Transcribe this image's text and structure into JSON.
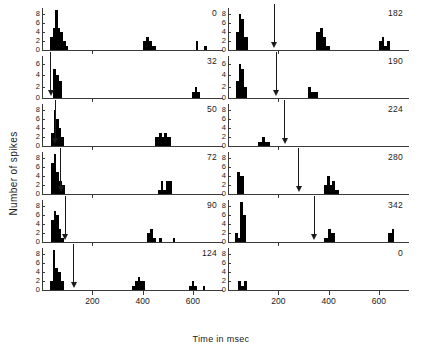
{
  "chart_data": {
    "type": "bar",
    "title": "",
    "xlabel": "Time in msec",
    "ylabel": "Number of spikes",
    "xlim": [
      0,
      720
    ],
    "ylim": [
      0,
      9
    ],
    "xticks": [
      200,
      400,
      600
    ],
    "xticklabels": [
      "200",
      "400",
      "600"
    ],
    "yticks": [
      0,
      2,
      4,
      6,
      8
    ],
    "yticklabels": [
      "0",
      "2",
      "4",
      "6",
      "8"
    ],
    "grid": false,
    "legend": null,
    "bin_width": 10,
    "panel_annotation_note": "arrow marks delay value equal to panel label (msec)",
    "panels": [
      {
        "id": "panel-left-1",
        "label": "0",
        "column": "left",
        "row": 1,
        "arrow_x": null,
        "ymax": 9,
        "bars": [
          {
            "x": 30,
            "w": 12,
            "h": 3
          },
          {
            "x": 42,
            "w": 10,
            "h": 5
          },
          {
            "x": 52,
            "w": 10,
            "h": 9
          },
          {
            "x": 62,
            "w": 10,
            "h": 5
          },
          {
            "x": 72,
            "w": 10,
            "h": 4
          },
          {
            "x": 82,
            "w": 12,
            "h": 2
          },
          {
            "x": 94,
            "w": 10,
            "h": 1
          },
          {
            "x": 400,
            "w": 12,
            "h": 2
          },
          {
            "x": 412,
            "w": 12,
            "h": 3
          },
          {
            "x": 424,
            "w": 14,
            "h": 2
          },
          {
            "x": 438,
            "w": 14,
            "h": 1
          },
          {
            "x": 612,
            "w": 10,
            "h": 2
          },
          {
            "x": 646,
            "w": 12,
            "h": 1
          }
        ]
      },
      {
        "id": "panel-left-2",
        "label": "32",
        "column": "left",
        "row": 2,
        "arrow_x": 32,
        "ymax": 7,
        "bars": [
          {
            "x": 44,
            "w": 12,
            "h": 5
          },
          {
            "x": 56,
            "w": 10,
            "h": 4
          },
          {
            "x": 66,
            "w": 14,
            "h": 3
          },
          {
            "x": 596,
            "w": 12,
            "h": 1
          },
          {
            "x": 608,
            "w": 10,
            "h": 2
          },
          {
            "x": 618,
            "w": 12,
            "h": 1
          }
        ]
      },
      {
        "id": "panel-left-3",
        "label": "50",
        "column": "left",
        "row": 3,
        "arrow_x": 50,
        "ymax": 9,
        "bars": [
          {
            "x": 36,
            "w": 10,
            "h": 3
          },
          {
            "x": 46,
            "w": 10,
            "h": 8
          },
          {
            "x": 56,
            "w": 10,
            "h": 6
          },
          {
            "x": 66,
            "w": 10,
            "h": 4
          },
          {
            "x": 76,
            "w": 12,
            "h": 2
          },
          {
            "x": 450,
            "w": 14,
            "h": 2
          },
          {
            "x": 464,
            "w": 12,
            "h": 3
          },
          {
            "x": 476,
            "w": 10,
            "h": 2
          },
          {
            "x": 486,
            "w": 12,
            "h": 3
          },
          {
            "x": 498,
            "w": 14,
            "h": 2
          }
        ]
      },
      {
        "id": "panel-left-4",
        "label": "72",
        "column": "left",
        "row": 4,
        "arrow_x": 72,
        "ymax": 9,
        "bars": [
          {
            "x": 36,
            "w": 10,
            "h": 7
          },
          {
            "x": 46,
            "w": 10,
            "h": 9
          },
          {
            "x": 56,
            "w": 12,
            "h": 5
          },
          {
            "x": 68,
            "w": 12,
            "h": 3
          },
          {
            "x": 80,
            "w": 12,
            "h": 2
          },
          {
            "x": 460,
            "w": 12,
            "h": 1
          },
          {
            "x": 472,
            "w": 10,
            "h": 3
          },
          {
            "x": 482,
            "w": 12,
            "h": 1
          },
          {
            "x": 494,
            "w": 10,
            "h": 3
          },
          {
            "x": 504,
            "w": 14,
            "h": 3
          }
        ]
      },
      {
        "id": "panel-left-5",
        "label": "90",
        "column": "left",
        "row": 5,
        "arrow_x": 90,
        "ymax": 9,
        "bars": [
          {
            "x": 34,
            "w": 12,
            "h": 5
          },
          {
            "x": 46,
            "w": 10,
            "h": 7
          },
          {
            "x": 56,
            "w": 10,
            "h": 6
          },
          {
            "x": 66,
            "w": 10,
            "h": 3
          },
          {
            "x": 76,
            "w": 12,
            "h": 1
          },
          {
            "x": 418,
            "w": 10,
            "h": 2
          },
          {
            "x": 428,
            "w": 12,
            "h": 3
          },
          {
            "x": 440,
            "w": 12,
            "h": 1
          },
          {
            "x": 466,
            "w": 10,
            "h": 1
          },
          {
            "x": 520,
            "w": 10,
            "h": 1
          }
        ]
      },
      {
        "id": "panel-left-6",
        "label": "124",
        "column": "left",
        "row": 6,
        "arrow_x": 124,
        "ymax": 9,
        "bars": [
          {
            "x": 30,
            "w": 12,
            "h": 2
          },
          {
            "x": 42,
            "w": 10,
            "h": 9
          },
          {
            "x": 52,
            "w": 10,
            "h": 5
          },
          {
            "x": 62,
            "w": 12,
            "h": 4
          },
          {
            "x": 74,
            "w": 14,
            "h": 2
          },
          {
            "x": 358,
            "w": 12,
            "h": 1
          },
          {
            "x": 370,
            "w": 10,
            "h": 2
          },
          {
            "x": 380,
            "w": 10,
            "h": 3
          },
          {
            "x": 390,
            "w": 20,
            "h": 2
          },
          {
            "x": 586,
            "w": 10,
            "h": 1
          },
          {
            "x": 596,
            "w": 10,
            "h": 2
          },
          {
            "x": 606,
            "w": 10,
            "h": 1
          },
          {
            "x": 640,
            "w": 10,
            "h": 1
          }
        ]
      },
      {
        "id": "panel-right-1",
        "label": "182",
        "column": "right",
        "row": 1,
        "arrow_x": 182,
        "ymax": 9,
        "bars": [
          {
            "x": 30,
            "w": 12,
            "h": 4
          },
          {
            "x": 42,
            "w": 10,
            "h": 8
          },
          {
            "x": 52,
            "w": 12,
            "h": 7
          },
          {
            "x": 64,
            "w": 14,
            "h": 3
          },
          {
            "x": 352,
            "w": 14,
            "h": 4
          },
          {
            "x": 366,
            "w": 12,
            "h": 5
          },
          {
            "x": 378,
            "w": 12,
            "h": 3
          },
          {
            "x": 390,
            "w": 14,
            "h": 1
          },
          {
            "x": 600,
            "w": 12,
            "h": 2
          },
          {
            "x": 612,
            "w": 10,
            "h": 3
          },
          {
            "x": 622,
            "w": 10,
            "h": 1
          },
          {
            "x": 632,
            "w": 12,
            "h": 2
          }
        ]
      },
      {
        "id": "panel-right-2",
        "label": "190",
        "column": "right",
        "row": 2,
        "arrow_x": 190,
        "ymax": 7,
        "bars": [
          {
            "x": 30,
            "w": 12,
            "h": 3
          },
          {
            "x": 42,
            "w": 10,
            "h": 6
          },
          {
            "x": 52,
            "w": 10,
            "h": 5
          },
          {
            "x": 62,
            "w": 14,
            "h": 2
          },
          {
            "x": 318,
            "w": 14,
            "h": 2
          },
          {
            "x": 332,
            "w": 16,
            "h": 1
          },
          {
            "x": 348,
            "w": 12,
            "h": 1
          }
        ]
      },
      {
        "id": "panel-right-3",
        "label": "224",
        "column": "right",
        "row": 3,
        "arrow_x": 224,
        "ymax": 9,
        "bars": [
          {
            "x": 120,
            "w": 14,
            "h": 1
          },
          {
            "x": 134,
            "w": 12,
            "h": 2
          },
          {
            "x": 146,
            "w": 10,
            "h": 1
          },
          {
            "x": 156,
            "w": 12,
            "h": 1
          }
        ]
      },
      {
        "id": "panel-right-4",
        "label": "280",
        "column": "right",
        "row": 4,
        "arrow_x": 280,
        "ymax": 9,
        "bars": [
          {
            "x": 34,
            "w": 14,
            "h": 5
          },
          {
            "x": 48,
            "w": 14,
            "h": 4
          },
          {
            "x": 380,
            "w": 14,
            "h": 2
          },
          {
            "x": 394,
            "w": 10,
            "h": 4
          },
          {
            "x": 404,
            "w": 10,
            "h": 2
          },
          {
            "x": 414,
            "w": 12,
            "h": 3
          },
          {
            "x": 426,
            "w": 14,
            "h": 1
          }
        ]
      },
      {
        "id": "panel-right-5",
        "label": "342",
        "column": "right",
        "row": 5,
        "arrow_x": 342,
        "ymax": 9,
        "bars": [
          {
            "x": 26,
            "w": 12,
            "h": 2
          },
          {
            "x": 38,
            "w": 10,
            "h": 1
          },
          {
            "x": 48,
            "w": 10,
            "h": 9
          },
          {
            "x": 58,
            "w": 14,
            "h": 6
          },
          {
            "x": 382,
            "w": 14,
            "h": 1
          },
          {
            "x": 396,
            "w": 14,
            "h": 3
          },
          {
            "x": 410,
            "w": 14,
            "h": 2
          },
          {
            "x": 636,
            "w": 18,
            "h": 2
          },
          {
            "x": 654,
            "w": 8,
            "h": 3
          }
        ]
      },
      {
        "id": "panel-right-6",
        "label": "0",
        "column": "right",
        "row": 6,
        "arrow_x": null,
        "ymax": 9,
        "bars": [
          {
            "x": 40,
            "w": 12,
            "h": 2
          },
          {
            "x": 52,
            "w": 10,
            "h": 1
          },
          {
            "x": 62,
            "w": 14,
            "h": 2
          }
        ]
      }
    ]
  }
}
